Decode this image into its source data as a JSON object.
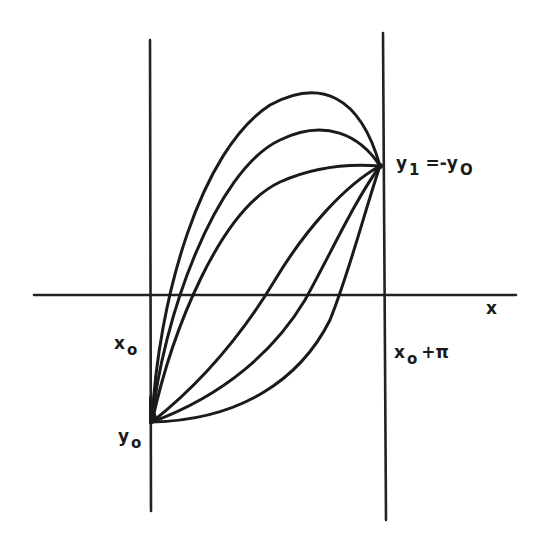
{
  "diagram": {
    "labels": {
      "x_axis": "x",
      "x0_main": "x",
      "x0_sub": "o",
      "x1_main": "x",
      "x1_sub": "o",
      "x1_suffix": "+π",
      "y0_main": "y",
      "y0_sub": "o",
      "y1_main": "y",
      "y1_sub": "1",
      "y1_eq": "=-y",
      "y1_eq_sub": "O"
    },
    "colors": {
      "ink": "#1a1a1a",
      "background": "#ffffff"
    },
    "curve_count": 6
  }
}
